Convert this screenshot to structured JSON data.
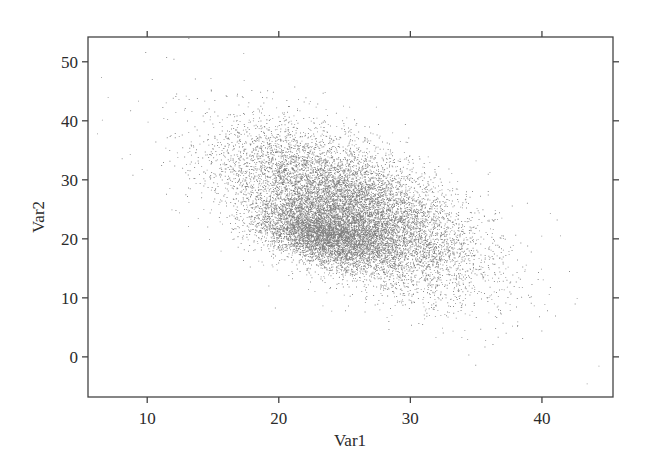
{
  "chart_data": {
    "type": "scatter",
    "title": "",
    "xlabel": "Var1",
    "ylabel": "Var2",
    "xlim": [
      5.5,
      45.4
    ],
    "ylim": [
      -6.8,
      54.2
    ],
    "xticks": [
      10,
      20,
      30,
      40
    ],
    "yticks": [
      0,
      10,
      20,
      30,
      40,
      50
    ],
    "xtick_labels": [
      "10",
      "20",
      "30",
      "40"
    ],
    "ytick_labels": [
      "0",
      "10",
      "20",
      "30",
      "40",
      "50"
    ],
    "grid": false,
    "legend": null,
    "point_color": "#1a1a1a",
    "point_opacity": 0.55,
    "point_size": 0.9,
    "distribution": {
      "description": "Dense cloud of small points with strong negative correlation between Var1 and Var2; a denser core near Var1≈23, Var2≈20.",
      "components": [
        {
          "weight": 0.72,
          "mean": [
            25.5,
            25.0
          ],
          "sd": [
            4.8,
            6.8
          ],
          "corr": -0.6
        },
        {
          "weight": 0.28,
          "mean": [
            23.5,
            20.5
          ],
          "sd": [
            2.6,
            2.6
          ],
          "corr": -0.45
        }
      ],
      "n_points": 14000,
      "seed": 20240611
    },
    "outliers": [
      {
        "x": 7.0,
        "y": 44.0
      },
      {
        "x": 9.3,
        "y": 43.4
      },
      {
        "x": 12.0,
        "y": 50.5
      },
      {
        "x": 11.2,
        "y": 33.0
      },
      {
        "x": 17.3,
        "y": 51.5
      },
      {
        "x": 43.4,
        "y": -4.5
      },
      {
        "x": 44.3,
        "y": -1.5
      },
      {
        "x": 41.0,
        "y": 7.0
      },
      {
        "x": 38.5,
        "y": 3.2
      }
    ]
  },
  "layout": {
    "plot_box": {
      "left": 88,
      "top": 37,
      "right": 613,
      "bottom": 397
    },
    "frame_color": "#444444",
    "tick_length": 6
  }
}
